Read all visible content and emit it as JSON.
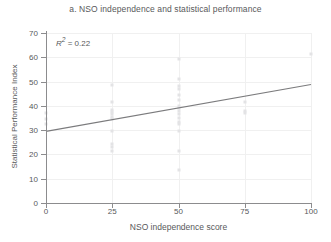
{
  "chart_data": {
    "type": "scatter",
    "title": "a. NSO independence and statistical performance",
    "xlabel": "NSO independence score",
    "ylabel": "Statistical Performance Index",
    "xlim": [
      0,
      100
    ],
    "ylim": [
      0,
      70
    ],
    "xticks": [
      0,
      25,
      50,
      75,
      100
    ],
    "yticks": [
      0,
      10,
      20,
      30,
      40,
      50,
      60,
      70
    ],
    "grid": true,
    "legend": null,
    "annotations": [
      {
        "text_prefix": "R",
        "text_sup": "2",
        "text_rest": " = 0.22",
        "value": 0.22
      }
    ],
    "series": [
      {
        "name": "Countries",
        "type": "scatter",
        "marker_color": "#e3e3e5",
        "points": [
          {
            "x": 0,
            "y": 37.0
          },
          {
            "x": 0,
            "y": 34.5
          },
          {
            "x": 0,
            "y": 32.5
          },
          {
            "x": 25,
            "y": 48.5
          },
          {
            "x": 25,
            "y": 41.5
          },
          {
            "x": 25,
            "y": 38.5
          },
          {
            "x": 25,
            "y": 37.5
          },
          {
            "x": 25,
            "y": 36.5
          },
          {
            "x": 25,
            "y": 35.5
          },
          {
            "x": 25,
            "y": 34.5
          },
          {
            "x": 25,
            "y": 29.5
          },
          {
            "x": 25,
            "y": 24.5
          },
          {
            "x": 25,
            "y": 23.0
          },
          {
            "x": 25,
            "y": 21.5
          },
          {
            "x": 50,
            "y": 59.5
          },
          {
            "x": 50,
            "y": 51.0
          },
          {
            "x": 50,
            "y": 48.0
          },
          {
            "x": 50,
            "y": 47.0
          },
          {
            "x": 50,
            "y": 44.5
          },
          {
            "x": 50,
            "y": 42.5
          },
          {
            "x": 50,
            "y": 40.0
          },
          {
            "x": 50,
            "y": 39.0
          },
          {
            "x": 50,
            "y": 38.0
          },
          {
            "x": 50,
            "y": 36.5
          },
          {
            "x": 50,
            "y": 35.0
          },
          {
            "x": 50,
            "y": 33.5
          },
          {
            "x": 50,
            "y": 32.5
          },
          {
            "x": 50,
            "y": 29.5
          },
          {
            "x": 50,
            "y": 21.5
          },
          {
            "x": 50,
            "y": 13.5
          },
          {
            "x": 75,
            "y": 41.5
          },
          {
            "x": 75,
            "y": 38.0
          },
          {
            "x": 75,
            "y": 37.0
          },
          {
            "x": 100,
            "y": 61.5
          }
        ]
      },
      {
        "name": "Fitted trend",
        "type": "line",
        "line_color": "#7b7b7d",
        "x": [
          0,
          100
        ],
        "y": [
          29.5,
          48.8
        ]
      }
    ]
  }
}
